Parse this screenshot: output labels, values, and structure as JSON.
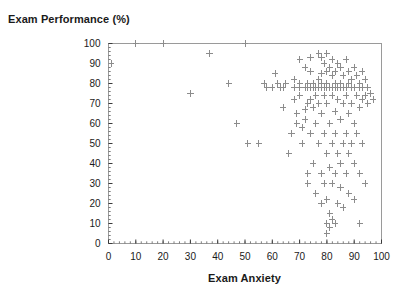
{
  "chart_data": {
    "type": "scatter",
    "title": "Exam Performance (%)",
    "xlabel": "Exam Anxiety",
    "ylabel": "Exam Performance (%)",
    "xlim": [
      0,
      100
    ],
    "ylim": [
      0,
      100
    ],
    "xticks": [
      0,
      10,
      20,
      30,
      40,
      50,
      60,
      70,
      80,
      90,
      100
    ],
    "yticks": [
      0,
      10,
      20,
      30,
      40,
      50,
      60,
      70,
      80,
      90,
      100
    ],
    "xtick_labels": [
      "0",
      "10",
      "20",
      "30",
      "40",
      "50",
      "60",
      "70",
      "80",
      "90",
      "100"
    ],
    "ytick_labels": [
      "0",
      "10",
      "20",
      "30",
      "40",
      "50",
      "60",
      "70",
      "80",
      "90",
      "100"
    ],
    "minor_tick_step": 2,
    "grid": false,
    "legend": null,
    "marker": "plus",
    "marker_color": "#8c8c8c",
    "frame_color": "#9a9a9a",
    "points": [
      [
        1,
        90
      ],
      [
        10,
        100
      ],
      [
        20,
        100
      ],
      [
        30,
        75
      ],
      [
        37,
        95
      ],
      [
        44,
        80
      ],
      [
        50,
        100
      ],
      [
        47,
        60
      ],
      [
        51,
        50
      ],
      [
        55,
        50
      ],
      [
        57,
        80
      ],
      [
        58,
        78
      ],
      [
        60,
        78
      ],
      [
        61,
        85
      ],
      [
        62,
        80
      ],
      [
        63,
        78
      ],
      [
        64,
        78
      ],
      [
        64,
        68
      ],
      [
        65,
        80
      ],
      [
        66,
        45
      ],
      [
        67,
        55
      ],
      [
        68,
        82
      ],
      [
        68,
        78
      ],
      [
        68,
        72
      ],
      [
        69,
        65
      ],
      [
        69,
        60
      ],
      [
        70,
        92
      ],
      [
        70,
        80
      ],
      [
        70,
        78
      ],
      [
        70,
        74
      ],
      [
        71,
        58
      ],
      [
        71,
        50
      ],
      [
        72,
        88
      ],
      [
        72,
        78
      ],
      [
        72,
        67
      ],
      [
        72,
        62
      ],
      [
        73,
        80
      ],
      [
        73,
        78
      ],
      [
        73,
        70
      ],
      [
        73,
        35
      ],
      [
        73,
        30
      ],
      [
        74,
        93
      ],
      [
        74,
        86
      ],
      [
        74,
        78
      ],
      [
        74,
        72
      ],
      [
        74,
        55
      ],
      [
        75,
        80
      ],
      [
        75,
        78
      ],
      [
        75,
        68
      ],
      [
        75,
        40
      ],
      [
        76,
        78
      ],
      [
        76,
        74
      ],
      [
        76,
        60
      ],
      [
        76,
        25
      ],
      [
        77,
        95
      ],
      [
        77,
        82
      ],
      [
        77,
        78
      ],
      [
        77,
        70
      ],
      [
        77,
        50
      ],
      [
        78,
        93
      ],
      [
        78,
        85
      ],
      [
        78,
        80
      ],
      [
        78,
        78
      ],
      [
        78,
        65
      ],
      [
        78,
        35
      ],
      [
        78,
        20
      ],
      [
        79,
        90
      ],
      [
        79,
        78
      ],
      [
        79,
        74
      ],
      [
        79,
        55
      ],
      [
        79,
        30
      ],
      [
        80,
        95
      ],
      [
        80,
        86
      ],
      [
        80,
        80
      ],
      [
        80,
        78
      ],
      [
        80,
        70
      ],
      [
        80,
        45
      ],
      [
        80,
        22
      ],
      [
        80,
        10
      ],
      [
        80,
        5
      ],
      [
        81,
        88
      ],
      [
        81,
        78
      ],
      [
        81,
        60
      ],
      [
        81,
        38
      ],
      [
        81,
        15
      ],
      [
        81,
        8
      ],
      [
        82,
        92
      ],
      [
        82,
        84
      ],
      [
        82,
        78
      ],
      [
        82,
        74
      ],
      [
        82,
        50
      ],
      [
        82,
        30
      ],
      [
        82,
        12
      ],
      [
        83,
        86
      ],
      [
        83,
        80
      ],
      [
        83,
        78
      ],
      [
        83,
        66
      ],
      [
        83,
        55
      ],
      [
        83,
        35
      ],
      [
        83,
        10
      ],
      [
        84,
        90
      ],
      [
        84,
        78
      ],
      [
        84,
        72
      ],
      [
        84,
        45
      ],
      [
        84,
        20
      ],
      [
        85,
        88
      ],
      [
        85,
        80
      ],
      [
        85,
        78
      ],
      [
        85,
        62
      ],
      [
        85,
        40
      ],
      [
        85,
        28
      ],
      [
        86,
        84
      ],
      [
        86,
        78
      ],
      [
        86,
        70
      ],
      [
        86,
        50
      ],
      [
        86,
        18
      ],
      [
        87,
        92
      ],
      [
        87,
        78
      ],
      [
        87,
        74
      ],
      [
        87,
        55
      ],
      [
        87,
        35
      ],
      [
        88,
        86
      ],
      [
        88,
        80
      ],
      [
        88,
        65
      ],
      [
        88,
        45
      ],
      [
        88,
        25
      ],
      [
        89,
        82
      ],
      [
        89,
        78
      ],
      [
        89,
        70
      ],
      [
        89,
        50
      ],
      [
        90,
        88
      ],
      [
        90,
        78
      ],
      [
        90,
        60
      ],
      [
        90,
        40
      ],
      [
        90,
        22
      ],
      [
        91,
        84
      ],
      [
        91,
        74
      ],
      [
        91,
        55
      ],
      [
        92,
        80
      ],
      [
        92,
        78
      ],
      [
        92,
        68
      ],
      [
        92,
        35
      ],
      [
        92,
        10
      ],
      [
        93,
        86
      ],
      [
        93,
        78
      ],
      [
        93,
        72
      ],
      [
        93,
        50
      ],
      [
        94,
        82
      ],
      [
        94,
        74
      ],
      [
        94,
        30
      ],
      [
        95,
        78
      ],
      [
        95,
        70
      ],
      [
        96,
        75
      ],
      [
        97,
        72
      ]
    ]
  }
}
